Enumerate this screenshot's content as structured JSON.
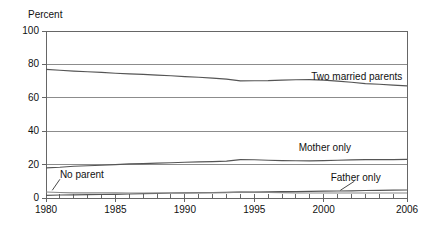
{
  "chart_data": {
    "type": "line",
    "title": "",
    "subtitle": "",
    "xlabel": "",
    "ylabel": "Percent",
    "xlim": [
      1980,
      2006
    ],
    "ylim": [
      0,
      100
    ],
    "grid": "horizontal",
    "legend_position": "inline-annotations",
    "x": [
      1980,
      1981,
      1982,
      1983,
      1984,
      1985,
      1986,
      1987,
      1988,
      1989,
      1990,
      1991,
      1992,
      1993,
      1994,
      1995,
      1996,
      1997,
      1998,
      1999,
      2000,
      2001,
      2002,
      2003,
      2004,
      2005,
      2006
    ],
    "xticks": [
      1980,
      1985,
      1990,
      1995,
      2000,
      2006
    ],
    "xtick_labels": [
      "1980",
      "1985",
      "1990",
      "1995",
      "2000",
      "2006"
    ],
    "yticks": [
      0,
      20,
      40,
      60,
      80,
      100
    ],
    "ytick_labels": [
      "0",
      "20",
      "40",
      "60",
      "80",
      "100"
    ],
    "minor_xticks_every": 1,
    "series": [
      {
        "name": "Two married parents",
        "label": "Two married parents",
        "color": "#555555",
        "label_x": 1999.1,
        "label_y": 72.5,
        "values": [
          77.0,
          76.5,
          76.0,
          75.6,
          75.2,
          74.7,
          74.3,
          74.0,
          73.6,
          73.2,
          72.7,
          72.3,
          71.8,
          71.2,
          70.1,
          70.2,
          70.3,
          70.6,
          70.8,
          70.9,
          70.6,
          70.0,
          69.3,
          68.5,
          68.1,
          67.6,
          67.2
        ]
      },
      {
        "name": "Mother only",
        "label": "Mother only",
        "color": "#555555",
        "label_x": 1998.2,
        "label_y": 30.0,
        "values": [
          18.0,
          18.4,
          19.0,
          19.3,
          19.6,
          20.0,
          20.4,
          20.6,
          20.9,
          21.1,
          21.4,
          21.6,
          21.8,
          22.1,
          23.0,
          22.9,
          22.6,
          22.4,
          22.3,
          22.2,
          22.4,
          22.6,
          22.8,
          23.0,
          23.0,
          23.0,
          23.1
        ]
      },
      {
        "name": "Father only",
        "label": "Father only",
        "color": "#555555",
        "label_x": 2000.5,
        "label_y": 12.0,
        "values": [
          1.6,
          1.8,
          1.9,
          2.0,
          2.1,
          2.2,
          2.4,
          2.6,
          2.8,
          3.0,
          3.1,
          3.2,
          3.3,
          3.4,
          3.5,
          3.6,
          3.7,
          3.8,
          3.9,
          4.0,
          4.1,
          4.2,
          4.3,
          4.5,
          4.6,
          4.7,
          4.8
        ]
      },
      {
        "name": "No parent",
        "label": "No parent",
        "color": "#888888",
        "label_x": 1981.0,
        "label_y": 13.5,
        "values": [
          3.6,
          3.3,
          3.1,
          3.1,
          3.1,
          3.1,
          3.0,
          3.0,
          3.0,
          3.0,
          3.1,
          3.1,
          3.1,
          3.2,
          3.5,
          3.4,
          3.3,
          3.2,
          3.1,
          3.0,
          3.0,
          3.0,
          3.0,
          3.0,
          3.0,
          3.0,
          3.0
        ]
      }
    ],
    "annotations": [
      {
        "name": "no-parent-leader",
        "from_x": 1981.0,
        "from_y": 11.2,
        "to_x": 1980.45,
        "to_y": 4.6
      },
      {
        "name": "father-only-leader",
        "from_x": 2002.2,
        "from_y": 10.0,
        "to_x": 2001.2,
        "to_y": 4.6
      }
    ],
    "axis_color": "#666666",
    "grid_color": "#8c8c8c",
    "background": "#ffffff"
  }
}
